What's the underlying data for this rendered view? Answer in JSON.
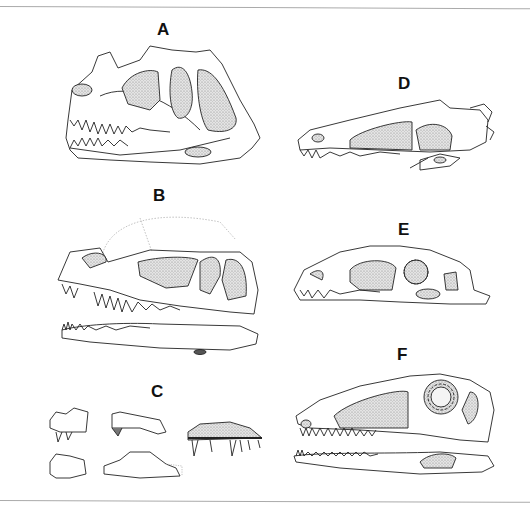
{
  "figure": {
    "panels": [
      {
        "id": "A",
        "label": "A",
        "description": "Lateral view of theropod skull with nasal crest, large antorbital fenestra and articulated lower jaw"
      },
      {
        "id": "B",
        "label": "B",
        "description": "Reconstructed skull with dotted skull roof outline, separated lower jaw below"
      },
      {
        "id": "C",
        "label": "C",
        "description": "Fragmentary jaw and premaxilla elements with teeth"
      },
      {
        "id": "D",
        "label": "D",
        "description": "Elongated low skull in lateral view"
      },
      {
        "id": "E",
        "label": "E",
        "description": "Skull with sclerotic ring in orbit"
      },
      {
        "id": "F",
        "label": "F",
        "description": "Long-snouted skull with sclerotic ring and separate lower jaw"
      }
    ],
    "colors": {
      "line": "#222222",
      "stipple": "#c8c8c8",
      "dotted_outline": "#bbbbbb",
      "rule": "#aaaaaa"
    }
  }
}
